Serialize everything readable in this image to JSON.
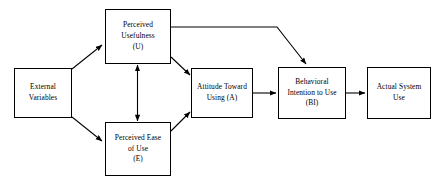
{
  "diagram": {
    "type": "flow-diagram",
    "canvas": {
      "width": 442,
      "height": 188
    },
    "background_color": "#ffffff",
    "line_color": "#000000",
    "text_color": "#000000",
    "nodes": [
      {
        "id": "external-variables",
        "label": "External\nVariables",
        "shape": "rectangle",
        "x": 14,
        "y": 68,
        "width": 58,
        "height": 50
      },
      {
        "id": "perceived-usefulness",
        "label": "Perceived\nUsefulness\n(U)",
        "shape": "rectangle",
        "x": 105,
        "y": 9,
        "width": 66,
        "height": 55
      },
      {
        "id": "perceived-ease-of-use",
        "label": "Perceived Ease\nof Use\n(E)",
        "shape": "rectangle",
        "x": 105,
        "y": 122,
        "width": 66,
        "height": 54
      },
      {
        "id": "attitude-toward-using",
        "label": "Attitude Toward\nUsing (A)",
        "shape": "rectangle",
        "x": 191,
        "y": 68,
        "width": 62,
        "height": 50
      },
      {
        "id": "behavioral-intention-to-use",
        "label": "Behavioral\nIntention to Use\n(BI)",
        "shape": "rectangle",
        "x": 278,
        "y": 67,
        "width": 68,
        "height": 52
      },
      {
        "id": "actual-system-use",
        "label": "Actual System\nUse",
        "shape": "rectangle",
        "x": 367,
        "y": 67,
        "width": 64,
        "height": 52
      }
    ],
    "edges": [
      {
        "id": "external-to-usefulness",
        "from": "external-variables",
        "to": "perceived-usefulness",
        "style": "straight",
        "arrowheads": "end"
      },
      {
        "id": "external-to-ease-of-use",
        "from": "external-variables",
        "to": "perceived-ease-of-use",
        "style": "straight",
        "arrowheads": "end"
      },
      {
        "id": "ease-of-use-to-usefulness",
        "from": "perceived-ease-of-use",
        "to": "perceived-usefulness",
        "style": "straight-vertical",
        "arrowheads": "both"
      },
      {
        "id": "usefulness-to-attitude",
        "from": "perceived-usefulness",
        "to": "attitude-toward-using",
        "style": "straight",
        "arrowheads": "end"
      },
      {
        "id": "ease-of-use-to-attitude",
        "from": "perceived-ease-of-use",
        "to": "attitude-toward-using",
        "style": "straight",
        "arrowheads": "end"
      },
      {
        "id": "usefulness-to-behavioral-intention",
        "from": "perceived-usefulness",
        "to": "behavioral-intention-to-use",
        "style": "elbow",
        "arrowheads": "end"
      },
      {
        "id": "attitude-to-behavioral-intention",
        "from": "attitude-toward-using",
        "to": "behavioral-intention-to-use",
        "style": "straight-horizontal",
        "arrowheads": "end"
      },
      {
        "id": "behavioral-intention-to-actual-use",
        "from": "behavioral-intention-to-use",
        "to": "actual-system-use",
        "style": "straight-horizontal",
        "arrowheads": "end"
      }
    ]
  }
}
